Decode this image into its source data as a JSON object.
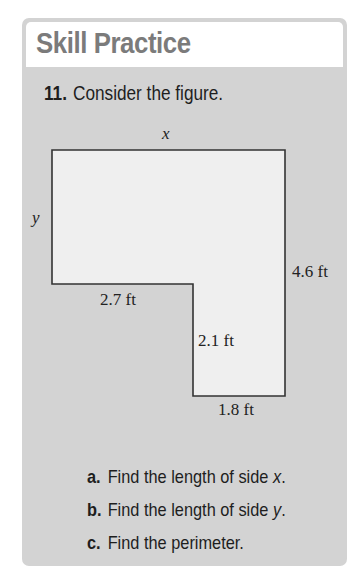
{
  "section": {
    "title": "Skill Practice"
  },
  "problem": {
    "number": "11.",
    "prompt": "Consider the figure."
  },
  "figure": {
    "shape": "L-shaped polygon",
    "colors": {
      "panel_background": "#d3d3d3",
      "figure_fill": "#efefef",
      "outline": "#333333",
      "header_background": "#ffffff",
      "title_text": "#7b7b7b"
    },
    "labels": {
      "top": "x",
      "left": "y",
      "right": "4.6 ft",
      "notch_horizontal": "2.7 ft",
      "notch_vertical": "2.1 ft",
      "bottom": "1.8 ft"
    }
  },
  "subparts": [
    {
      "letter": "a.",
      "text_before": "Find the length of side ",
      "variable": "x",
      "text_after": "."
    },
    {
      "letter": "b.",
      "text_before": "Find the length of side ",
      "variable": "y",
      "text_after": "."
    },
    {
      "letter": "c.",
      "text_before": "Find the perimeter.",
      "variable": "",
      "text_after": ""
    }
  ]
}
